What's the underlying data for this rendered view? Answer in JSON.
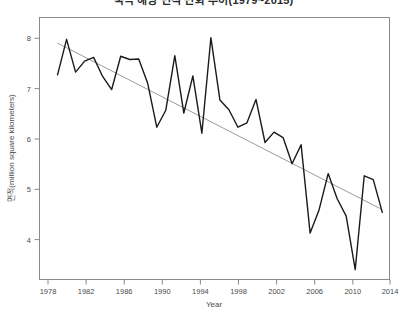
{
  "chart_data": {
    "type": "line",
    "title": "북극 해빙 면적 변화 추이(1979~2015)",
    "xlabel": "Year",
    "ylabel": "면적(million square kilometers)",
    "xlim": [
      1977.0,
      2015.8
    ],
    "ylim": [
      3.45,
      8.25
    ],
    "xticks": [
      1978,
      1982,
      1986,
      1990,
      1994,
      1998,
      2002,
      2006,
      2010,
      2014
    ],
    "yticks": [
      4,
      5,
      6,
      7,
      8
    ],
    "grid": false,
    "legend": false,
    "series": [
      {
        "name": "sea-ice-extent",
        "color": "#1a1a1a",
        "x": [
          1979,
          1980,
          1981,
          1982,
          1983,
          1984,
          1985,
          1986,
          1987,
          1988,
          1989,
          1990,
          1991,
          1992,
          1993,
          1994,
          1995,
          1996,
          1997,
          1998,
          1999,
          2000,
          2001,
          2002,
          2003,
          2004,
          2005,
          2006,
          2007,
          2008,
          2009,
          2010,
          2011,
          2012,
          2013,
          2014,
          2015
        ],
        "values": [
          7.2,
          7.85,
          7.25,
          7.45,
          7.52,
          7.17,
          6.93,
          7.54,
          7.48,
          7.49,
          7.04,
          6.24,
          6.55,
          7.55,
          6.5,
          7.18,
          6.13,
          7.88,
          6.74,
          6.56,
          6.24,
          6.32,
          6.75,
          5.96,
          6.15,
          6.05,
          5.57,
          5.92,
          4.3,
          4.73,
          5.39,
          4.93,
          4.61,
          3.63,
          5.35,
          5.28,
          4.68
        ]
      },
      {
        "name": "linear-trend",
        "color": "#9b9b9b",
        "x": [
          1979,
          2015
        ],
        "values": [
          7.78,
          4.73
        ]
      }
    ]
  }
}
